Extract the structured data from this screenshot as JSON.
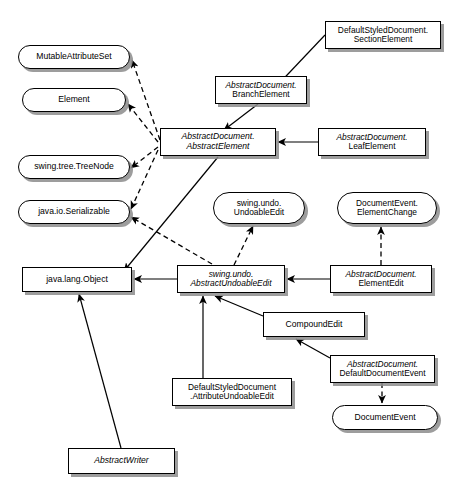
{
  "diagram": {
    "type": "uml-class-diagram",
    "width": 464,
    "height": 503,
    "background_color": "#ffffff",
    "line_color": "#000000",
    "shadow_color": "#8c8c8c",
    "legend": {
      "solid_arrow_meaning": "extends / inheritance",
      "dashed_arrow_meaning": "implements / realization"
    }
  },
  "nodes": [
    {
      "id": "mutable-attribute-set",
      "shape": "interface",
      "text": "MutableAttributeSet",
      "lines": [
        "MutableAttributeSet"
      ],
      "italic": false,
      "x": 18,
      "y": 45,
      "w": 112,
      "h": 24,
      "font_size": 8.6
    },
    {
      "id": "element",
      "shape": "interface",
      "text": "Element",
      "lines": [
        "Element"
      ],
      "italic": false,
      "x": 22,
      "y": 88,
      "w": 104,
      "h": 24,
      "font_size": 8.6
    },
    {
      "id": "swing-tree-treenode",
      "shape": "interface",
      "text": "swing.tree.TreeNode",
      "lines": [
        "swing.tree.TreeNode"
      ],
      "italic": false,
      "x": 18,
      "y": 155,
      "w": 112,
      "h": 24,
      "font_size": 8.6
    },
    {
      "id": "java-io-serializable",
      "shape": "interface",
      "text": "java.io.Serializable",
      "lines": [
        "java.io.Serializable"
      ],
      "italic": false,
      "x": 18,
      "y": 200,
      "w": 112,
      "h": 24,
      "font_size": 8.6
    },
    {
      "id": "default-styled-document-section-element",
      "shape": "class",
      "text": "DefaultStyledDocument.\nSectionElement",
      "lines": [
        "DefaultStyledDocument.",
        "SectionElement"
      ],
      "italic": false,
      "x": 325,
      "y": 21,
      "w": 116,
      "h": 28,
      "font_size": 8.4
    },
    {
      "id": "abstract-document-branch-element",
      "shape": "class",
      "text": "AbstractDocument.\nBranchElement",
      "lines": [
        "AbstractDocument.",
        "BranchElement"
      ],
      "italic": false,
      "mixed_italic": true,
      "x": 215,
      "y": 76,
      "w": 92,
      "h": 28,
      "font_size": 8.4
    },
    {
      "id": "abstract-document-abstract-element",
      "shape": "class",
      "text": "AbstractDocument.\nAbstractElement",
      "lines": [
        "AbstractDocument.",
        "AbstractElement"
      ],
      "italic": true,
      "x": 160,
      "y": 128,
      "w": 116,
      "h": 28,
      "font_size": 8.6
    },
    {
      "id": "abstract-document-leaf-element",
      "shape": "class",
      "text": "AbstractDocument.\nLeafElement",
      "lines": [
        "AbstractDocument.",
        "LeafElement"
      ],
      "italic": false,
      "mixed_italic": true,
      "x": 318,
      "y": 128,
      "w": 108,
      "h": 28,
      "font_size": 8.4
    },
    {
      "id": "swing-undo-undoable-edit",
      "shape": "interface",
      "text": "swing.undo.\nUndoableEdit",
      "lines": [
        "swing.undo.",
        "UndoableEdit"
      ],
      "italic": false,
      "x": 213,
      "y": 192,
      "w": 92,
      "h": 32,
      "font_size": 8.4
    },
    {
      "id": "document-event-element-change",
      "shape": "interface",
      "text": "DocumentEvent.\nElementChange",
      "lines": [
        "DocumentEvent.",
        "ElementChange"
      ],
      "italic": false,
      "x": 337,
      "y": 192,
      "w": 100,
      "h": 32,
      "font_size": 8.4
    },
    {
      "id": "java-lang-object",
      "shape": "class",
      "text": "java.lang.Object",
      "lines": [
        "java.lang.Object"
      ],
      "italic": false,
      "x": 22,
      "y": 267,
      "w": 110,
      "h": 25,
      "font_size": 8.6
    },
    {
      "id": "swing-undo-abstract-undoable-edit",
      "shape": "class",
      "text": "swing.undo.\nAbstractUndoableEdit",
      "lines": [
        "swing.undo.",
        "AbstractUndoableEdit"
      ],
      "italic": true,
      "x": 177,
      "y": 265,
      "w": 108,
      "h": 28,
      "font_size": 8.4
    },
    {
      "id": "abstract-document-element-edit",
      "shape": "class",
      "text": "AbstractDocument.\nElementEdit",
      "lines": [
        "AbstractDocument.",
        "ElementEdit"
      ],
      "italic": false,
      "mixed_italic": true,
      "x": 330,
      "y": 265,
      "w": 102,
      "h": 28,
      "font_size": 8.4
    },
    {
      "id": "compound-edit",
      "shape": "class",
      "text": "CompoundEdit",
      "lines": [
        "CompoundEdit"
      ],
      "italic": false,
      "x": 263,
      "y": 312,
      "w": 102,
      "h": 25,
      "font_size": 8.6
    },
    {
      "id": "abstract-document-default-document-event",
      "shape": "class",
      "text": "AbstractDocument.\nDefaultDocumentEvent",
      "lines": [
        "AbstractDocument.",
        "DefaultDocumentEvent"
      ],
      "italic": false,
      "mixed_italic": true,
      "x": 330,
      "y": 355,
      "w": 105,
      "h": 28,
      "font_size": 8.4
    },
    {
      "id": "default-styled-document-attribute-undoable-edit",
      "shape": "class",
      "text": "DefaultStyledDocument\n.AttributeUndoableEdit",
      "lines": [
        "DefaultStyledDocument",
        ".AttributeUndoableEdit"
      ],
      "italic": false,
      "x": 172,
      "y": 378,
      "w": 120,
      "h": 28,
      "font_size": 8.4
    },
    {
      "id": "document-event",
      "shape": "interface",
      "text": "DocumentEvent",
      "lines": [
        "DocumentEvent"
      ],
      "italic": false,
      "x": 332,
      "y": 405,
      "w": 106,
      "h": 25,
      "font_size": 8.6
    },
    {
      "id": "abstract-writer",
      "shape": "class",
      "text": "AbstractWriter",
      "lines": [
        "AbstractWriter"
      ],
      "italic": true,
      "x": 68,
      "y": 448,
      "w": 107,
      "h": 26,
      "font_size": 8.6
    }
  ],
  "edges": [
    {
      "id": "e1",
      "from": "abstract-document-abstract-element",
      "to": "mutable-attribute-set",
      "style": "dashed",
      "points": "160,140 132,60"
    },
    {
      "id": "e2",
      "from": "abstract-document-abstract-element",
      "to": "element",
      "style": "dashed",
      "points": "158,142 128,104"
    },
    {
      "id": "e3",
      "from": "abstract-document-abstract-element",
      "to": "swing-tree-treenode",
      "style": "dashed",
      "points": "158,147 131,168"
    },
    {
      "id": "e4",
      "from": "abstract-document-abstract-element",
      "to": "java-io-serializable",
      "style": "dashed",
      "points": "158,150 131,209"
    },
    {
      "id": "e5",
      "from": "default-styled-document-section-element",
      "to": "abstract-document-branch-element",
      "style": "solid",
      "points": "325,35 271,92"
    },
    {
      "id": "e6",
      "from": "abstract-document-branch-element",
      "to": "abstract-document-abstract-element",
      "style": "solid",
      "points": "258,104 224,130"
    },
    {
      "id": "e7",
      "from": "abstract-document-leaf-element",
      "to": "abstract-document-abstract-element",
      "style": "solid",
      "points": "318,142 278,142"
    },
    {
      "id": "e8",
      "from": "abstract-document-abstract-element",
      "to": "java-lang-object",
      "style": "solid",
      "points": "218,157 124,271"
    },
    {
      "id": "e9",
      "from": "swing-undo-abstract-undoable-edit",
      "to": "swing-undo-undoable-edit",
      "style": "dashed",
      "points": "234,265 253,226"
    },
    {
      "id": "e10",
      "from": "swing-undo-abstract-undoable-edit",
      "to": "java-io-serializable",
      "style": "dashed",
      "points": "212,264 131,217"
    },
    {
      "id": "e11",
      "from": "swing-undo-abstract-undoable-edit",
      "to": "java-lang-object",
      "style": "solid",
      "points": "177,279 134,279"
    },
    {
      "id": "e12",
      "from": "abstract-document-element-edit",
      "to": "swing-undo-abstract-undoable-edit",
      "style": "solid",
      "points": "330,279 287,279"
    },
    {
      "id": "e13",
      "from": "abstract-document-element-edit",
      "to": "document-event-element-change",
      "style": "dashed",
      "points": "381,265 381,227"
    },
    {
      "id": "e14",
      "from": "compound-edit",
      "to": "swing-undo-abstract-undoable-edit",
      "style": "solid",
      "points": "263,316 215,296"
    },
    {
      "id": "e15",
      "from": "abstract-document-default-document-event",
      "to": "compound-edit",
      "style": "solid",
      "points": "330,358 296,339"
    },
    {
      "id": "e16",
      "from": "default-styled-document-attribute-undoable-edit",
      "to": "swing-undo-abstract-undoable-edit",
      "style": "solid",
      "points": "203,378 203,296"
    },
    {
      "id": "e17",
      "from": "abstract-document-default-document-event",
      "to": "document-event",
      "style": "dashed",
      "points": "382,383 382,403"
    },
    {
      "id": "e18",
      "from": "abstract-writer",
      "to": "java-lang-object",
      "style": "solid",
      "points": "121,448 79,294"
    }
  ]
}
